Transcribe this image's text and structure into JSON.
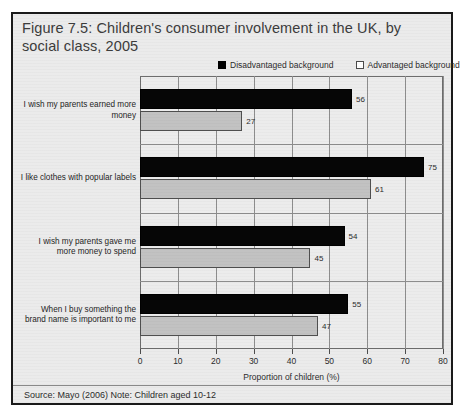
{
  "figure": {
    "title": "Figure 7.5: Children's consumer involvement in the UK, by social class, 2005",
    "source_note": "Source: Mayo (2006)   Note: Children aged 10-12"
  },
  "legend": {
    "items": [
      {
        "label": "Disadvantaged background",
        "swatch": "filled-square-icon",
        "color": "#000000"
      },
      {
        "label": "Advantaged background",
        "swatch": "outlined-square-icon",
        "color": "#ffffff"
      }
    ]
  },
  "chart_data": {
    "type": "bar",
    "orientation": "horizontal",
    "title": "Figure 7.5: Children's consumer involvement in the UK, by social class, 2005",
    "xlabel": "Proportion of children (%)",
    "ylabel": "",
    "xlim": [
      0,
      80
    ],
    "xticks": [
      0,
      10,
      20,
      30,
      40,
      50,
      60,
      70,
      80
    ],
    "grid": true,
    "legend_position": "top-right",
    "categories": [
      "I wish my parents earned more money",
      "I like clothes with popular labels",
      "I wish my parents gave me more money to spend",
      "When I buy something the brand name is important to me"
    ],
    "series": [
      {
        "name": "Disadvantaged background",
        "color": "#000000",
        "values": [
          56,
          75,
          54,
          55
        ]
      },
      {
        "name": "Advantaged background",
        "color": "#c2c2c2",
        "values": [
          27,
          61,
          45,
          47
        ]
      }
    ]
  }
}
